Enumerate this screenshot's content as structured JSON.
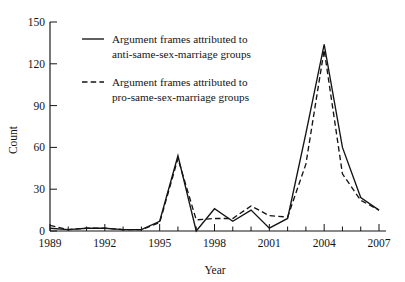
{
  "chart_data": {
    "type": "line",
    "title": "",
    "xlabel": "Year",
    "ylabel": "Count",
    "x": [
      1989,
      1990,
      1991,
      1992,
      1993,
      1994,
      1995,
      1996,
      1997,
      1998,
      1999,
      2000,
      2001,
      2002,
      2003,
      2004,
      2005,
      2006,
      2007
    ],
    "xlim": [
      1989,
      2007
    ],
    "ylim": [
      0,
      150
    ],
    "xticks": [
      "1989",
      "1992",
      "1995",
      "1998",
      "2001",
      "2004",
      "2007"
    ],
    "xtick_values": [
      1989,
      1992,
      1995,
      1998,
      2001,
      2004,
      2007
    ],
    "yticks": [
      "0",
      "30",
      "60",
      "90",
      "120",
      "150"
    ],
    "ytick_values": [
      0,
      30,
      60,
      90,
      120,
      150
    ],
    "grid": false,
    "legend_position": "upper-left-inside",
    "series": [
      {
        "name": "Argument frames attributed to anti-same-sex-marriage groups",
        "style": "solid",
        "color": "#141414",
        "values": [
          2,
          1,
          2,
          2,
          1,
          1,
          7,
          54,
          0,
          16,
          7,
          15,
          2,
          9,
          70,
          134,
          60,
          24,
          15
        ]
      },
      {
        "name": "Argument frames attributed to pro-same-sex-marriage groups",
        "style": "dashed",
        "color": "#141414",
        "values": [
          4,
          1,
          2,
          2,
          1,
          1,
          6,
          52,
          8,
          9,
          9,
          18,
          11,
          10,
          48,
          130,
          41,
          22,
          15
        ]
      }
    ]
  },
  "legend": {
    "entries": [
      {
        "line1": "Argument frames attributed to",
        "line2": "anti-same-sex-marriage groups",
        "style": "solid"
      },
      {
        "line1": "Argument frames attributed to",
        "line2": "pro-same-sex-marriage groups",
        "style": "dashed"
      }
    ]
  }
}
